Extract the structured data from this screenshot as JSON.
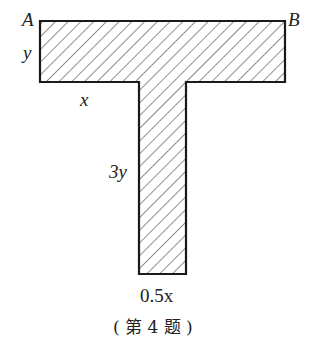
{
  "figure": {
    "labels": {
      "corner_left": "A",
      "corner_right": "B",
      "flange_height": "y",
      "flange_overhang": "x",
      "stem_height": "3y",
      "stem_width": "0.5x"
    },
    "caption": "( 第 4 题 )",
    "colors": {
      "stroke": "#1a1a1a",
      "hatch": "#333333",
      "background": "#ffffff"
    }
  }
}
